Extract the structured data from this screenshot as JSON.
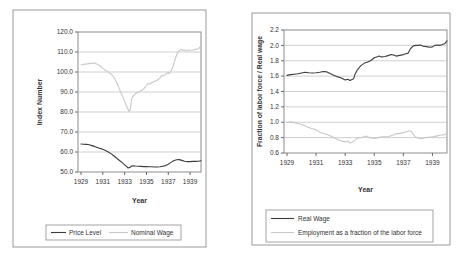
{
  "colors": {
    "background": "#ffffff",
    "frame_border": "#9a9a9a",
    "plot_border": "#808080",
    "gridline": "#c4c4c4",
    "axis": "#595959",
    "text": "#333333",
    "dark_series": "#3c3c3c",
    "light_series": "#c8c8c8"
  },
  "chart_data": [
    {
      "type": "line",
      "title": "",
      "xlabel": "Year",
      "ylabel": "Index Number",
      "xlim": [
        1929,
        1940
      ],
      "ylim": [
        50,
        120
      ],
      "x_ticks": [
        1929,
        1931,
        1933,
        1935,
        1937,
        1939
      ],
      "y_ticks": [
        "50.0",
        "60.0",
        "70.0",
        "80.0",
        "90.0",
        "100.0",
        "110.0",
        "120.0"
      ],
      "grid": "horizontal",
      "legend_position": "bottom-horizontal",
      "series": [
        {
          "name": "Price Level",
          "color": "#3c3c3c",
          "points": [
            [
              1929.0,
              64.0
            ],
            [
              1929.25,
              63.9
            ],
            [
              1929.5,
              63.8
            ],
            [
              1929.75,
              63.6
            ],
            [
              1930.0,
              63.2
            ],
            [
              1930.25,
              62.8
            ],
            [
              1930.5,
              62.3
            ],
            [
              1930.75,
              61.8
            ],
            [
              1931.0,
              61.4
            ],
            [
              1931.25,
              60.8
            ],
            [
              1931.5,
              60.0
            ],
            [
              1931.75,
              59.2
            ],
            [
              1932.0,
              58.1
            ],
            [
              1932.25,
              57.0
            ],
            [
              1932.5,
              55.9
            ],
            [
              1932.75,
              54.8
            ],
            [
              1933.0,
              53.6
            ],
            [
              1933.17,
              52.8
            ],
            [
              1933.33,
              52.0
            ],
            [
              1933.5,
              52.4
            ],
            [
              1933.67,
              53.0
            ],
            [
              1933.83,
              53.1
            ],
            [
              1934.0,
              53.0
            ],
            [
              1934.25,
              52.9
            ],
            [
              1934.5,
              52.8
            ],
            [
              1934.75,
              52.7
            ],
            [
              1935.0,
              52.7
            ],
            [
              1935.25,
              52.6
            ],
            [
              1935.5,
              52.6
            ],
            [
              1935.75,
              52.5
            ],
            [
              1936.0,
              52.5
            ],
            [
              1936.25,
              52.6
            ],
            [
              1936.5,
              52.9
            ],
            [
              1936.75,
              53.2
            ],
            [
              1937.0,
              53.9
            ],
            [
              1937.25,
              54.8
            ],
            [
              1937.5,
              55.6
            ],
            [
              1937.75,
              56.1
            ],
            [
              1938.0,
              56.2
            ],
            [
              1938.25,
              55.8
            ],
            [
              1938.5,
              55.4
            ],
            [
              1938.75,
              55.2
            ],
            [
              1939.0,
              55.2
            ],
            [
              1939.25,
              55.3
            ],
            [
              1939.5,
              55.3
            ],
            [
              1939.75,
              55.4
            ],
            [
              1940.0,
              55.6
            ]
          ]
        },
        {
          "name": "Nominal Wage",
          "color": "#c8c8c8",
          "points": [
            [
              1929.0,
              103.5
            ],
            [
              1929.25,
              103.8
            ],
            [
              1929.5,
              104.0
            ],
            [
              1929.75,
              104.2
            ],
            [
              1930.0,
              104.4
            ],
            [
              1930.17,
              104.5
            ],
            [
              1930.33,
              104.3
            ],
            [
              1930.5,
              103.9
            ],
            [
              1930.75,
              103.0
            ],
            [
              1931.0,
              101.8
            ],
            [
              1931.25,
              100.8
            ],
            [
              1931.5,
              100.0
            ],
            [
              1931.75,
              99.0
            ],
            [
              1932.0,
              97.5
            ],
            [
              1932.17,
              95.8
            ],
            [
              1932.33,
              94.0
            ],
            [
              1932.5,
              91.8
            ],
            [
              1932.67,
              89.5
            ],
            [
              1932.83,
              87.5
            ],
            [
              1933.0,
              85.5
            ],
            [
              1933.17,
              83.0
            ],
            [
              1933.33,
              81.3
            ],
            [
              1933.42,
              80.3
            ],
            [
              1933.5,
              81.0
            ],
            [
              1933.58,
              84.0
            ],
            [
              1933.67,
              87.0
            ],
            [
              1933.83,
              88.3
            ],
            [
              1934.0,
              89.2
            ],
            [
              1934.25,
              90.0
            ],
            [
              1934.5,
              90.6
            ],
            [
              1934.75,
              91.5
            ],
            [
              1935.0,
              93.3
            ],
            [
              1935.17,
              94.3
            ],
            [
              1935.33,
              94.0
            ],
            [
              1935.5,
              94.8
            ],
            [
              1935.75,
              95.3
            ],
            [
              1936.0,
              96.0
            ],
            [
              1936.25,
              97.0
            ],
            [
              1936.42,
              98.4
            ],
            [
              1936.58,
              98.0
            ],
            [
              1936.75,
              99.0
            ],
            [
              1937.0,
              99.8
            ],
            [
              1937.08,
              99.2
            ],
            [
              1937.25,
              100.5
            ],
            [
              1937.42,
              102.5
            ],
            [
              1937.58,
              105.5
            ],
            [
              1937.75,
              108.5
            ],
            [
              1937.92,
              110.3
            ],
            [
              1938.0,
              110.8
            ],
            [
              1938.17,
              111.2
            ],
            [
              1938.33,
              110.7
            ],
            [
              1938.5,
              111.0
            ],
            [
              1938.67,
              110.6
            ],
            [
              1938.83,
              111.0
            ],
            [
              1939.0,
              110.9
            ],
            [
              1939.25,
              111.0
            ],
            [
              1939.5,
              111.3
            ],
            [
              1939.75,
              111.6
            ],
            [
              1939.92,
              112.5
            ],
            [
              1940.0,
              113.5
            ]
          ]
        }
      ]
    },
    {
      "type": "line",
      "title": "",
      "xlabel": "Year",
      "ylabel": "Fraction of labor force / Real wage",
      "xlim": [
        1929,
        1940
      ],
      "ylim": [
        0.6,
        2.2
      ],
      "x_ticks": [
        1929,
        1931,
        1933,
        1935,
        1937,
        1939
      ],
      "y_ticks": [
        "0.6",
        "0.8",
        "1.0",
        "1.2",
        "1.4",
        "1.6",
        "1.8",
        "2.0",
        "2.2"
      ],
      "grid": "horizontal",
      "legend_position": "bottom-vertical",
      "series": [
        {
          "name": "Real Wage",
          "color": "#3c3c3c",
          "points": [
            [
              1929.0,
              1.61
            ],
            [
              1929.25,
              1.62
            ],
            [
              1929.5,
              1.625
            ],
            [
              1929.75,
              1.63
            ],
            [
              1930.0,
              1.64
            ],
            [
              1930.25,
              1.65
            ],
            [
              1930.5,
              1.645
            ],
            [
              1930.75,
              1.64
            ],
            [
              1931.0,
              1.645
            ],
            [
              1931.25,
              1.65
            ],
            [
              1931.5,
              1.66
            ],
            [
              1931.75,
              1.655
            ],
            [
              1932.0,
              1.63
            ],
            [
              1932.25,
              1.61
            ],
            [
              1932.5,
              1.59
            ],
            [
              1932.75,
              1.575
            ],
            [
              1933.0,
              1.55
            ],
            [
              1933.17,
              1.56
            ],
            [
              1933.33,
              1.545
            ],
            [
              1933.5,
              1.56
            ],
            [
              1933.58,
              1.565
            ],
            [
              1933.67,
              1.62
            ],
            [
              1933.83,
              1.68
            ],
            [
              1934.0,
              1.72
            ],
            [
              1934.17,
              1.75
            ],
            [
              1934.33,
              1.77
            ],
            [
              1934.5,
              1.78
            ],
            [
              1934.75,
              1.8
            ],
            [
              1935.0,
              1.84
            ],
            [
              1935.17,
              1.85
            ],
            [
              1935.33,
              1.86
            ],
            [
              1935.5,
              1.85
            ],
            [
              1935.75,
              1.855
            ],
            [
              1936.0,
              1.87
            ],
            [
              1936.17,
              1.88
            ],
            [
              1936.33,
              1.875
            ],
            [
              1936.5,
              1.86
            ],
            [
              1936.75,
              1.87
            ],
            [
              1937.0,
              1.88
            ],
            [
              1937.17,
              1.89
            ],
            [
              1937.33,
              1.9
            ],
            [
              1937.5,
              1.96
            ],
            [
              1937.67,
              1.99
            ],
            [
              1937.83,
              2.0
            ],
            [
              1938.0,
              2.0
            ],
            [
              1938.17,
              2.005
            ],
            [
              1938.33,
              1.99
            ],
            [
              1938.5,
              1.985
            ],
            [
              1938.67,
              1.98
            ],
            [
              1938.83,
              1.975
            ],
            [
              1939.0,
              1.98
            ],
            [
              1939.17,
              2.0
            ],
            [
              1939.33,
              2.005
            ],
            [
              1939.5,
              2.0
            ],
            [
              1939.67,
              2.01
            ],
            [
              1939.83,
              2.02
            ],
            [
              1940.0,
              2.06
            ]
          ]
        },
        {
          "name": "Employment as a fraction of the labor force",
          "color": "#c8c8c8",
          "points": [
            [
              1929.0,
              1.0
            ],
            [
              1929.25,
              1.005
            ],
            [
              1929.5,
              0.995
            ],
            [
              1929.75,
              0.985
            ],
            [
              1930.0,
              0.97
            ],
            [
              1930.25,
              0.95
            ],
            [
              1930.5,
              0.93
            ],
            [
              1930.75,
              0.915
            ],
            [
              1931.0,
              0.9
            ],
            [
              1931.25,
              0.875
            ],
            [
              1931.5,
              0.855
            ],
            [
              1931.75,
              0.84
            ],
            [
              1932.0,
              0.82
            ],
            [
              1932.25,
              0.795
            ],
            [
              1932.5,
              0.775
            ],
            [
              1932.75,
              0.755
            ],
            [
              1933.0,
              0.745
            ],
            [
              1933.17,
              0.755
            ],
            [
              1933.33,
              0.73
            ],
            [
              1933.5,
              0.74
            ],
            [
              1933.67,
              0.77
            ],
            [
              1933.83,
              0.79
            ],
            [
              1934.0,
              0.8
            ],
            [
              1934.17,
              0.805
            ],
            [
              1934.33,
              0.815
            ],
            [
              1934.5,
              0.82
            ],
            [
              1934.67,
              0.8
            ],
            [
              1934.83,
              0.795
            ],
            [
              1935.0,
              0.79
            ],
            [
              1935.25,
              0.8
            ],
            [
              1935.5,
              0.81
            ],
            [
              1935.75,
              0.81
            ],
            [
              1936.0,
              0.815
            ],
            [
              1936.25,
              0.83
            ],
            [
              1936.5,
              0.85
            ],
            [
              1936.75,
              0.855
            ],
            [
              1937.0,
              0.865
            ],
            [
              1937.17,
              0.875
            ],
            [
              1937.33,
              0.885
            ],
            [
              1937.5,
              0.89
            ],
            [
              1937.67,
              0.85
            ],
            [
              1937.83,
              0.81
            ],
            [
              1938.0,
              0.795
            ],
            [
              1938.17,
              0.785
            ],
            [
              1938.33,
              0.79
            ],
            [
              1938.5,
              0.8
            ],
            [
              1938.75,
              0.805
            ],
            [
              1939.0,
              0.81
            ],
            [
              1939.25,
              0.82
            ],
            [
              1939.5,
              0.83
            ],
            [
              1939.75,
              0.835
            ],
            [
              1940.0,
              0.85
            ]
          ]
        }
      ]
    }
  ]
}
